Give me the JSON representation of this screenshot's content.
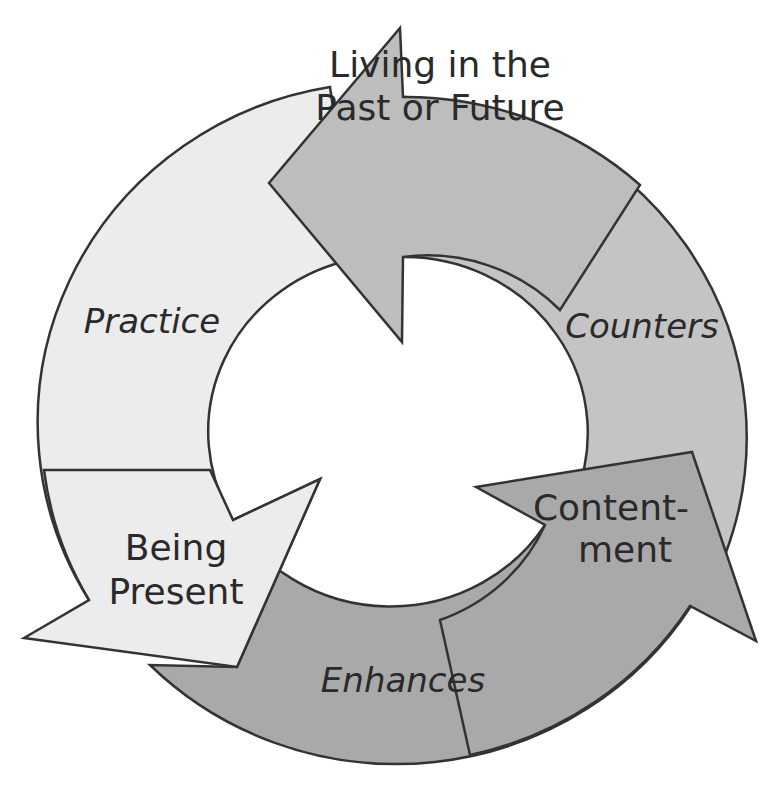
{
  "diagram": {
    "type": "cycle",
    "colors": {
      "background": "#ffffff",
      "stroke": "#333333",
      "text": "#2a2a2a",
      "practice_segment": "#ececec",
      "counters_segment": "#c4c4c4",
      "enhances_segment": "#a9a9a9"
    },
    "nodes": [
      {
        "id": "past-future",
        "line1": "Living in the",
        "line2": "Past or Future"
      },
      {
        "id": "contentment",
        "line1": "Content-",
        "line2": "ment"
      },
      {
        "id": "being-present",
        "line1": "Being",
        "line2": "Present"
      }
    ],
    "edges": [
      {
        "from": "being-present",
        "to": "past-future",
        "label": "Practice"
      },
      {
        "from": "past-future",
        "to": "contentment",
        "label": "Counters"
      },
      {
        "from": "contentment",
        "to": "being-present",
        "label": "Enhances"
      }
    ]
  }
}
